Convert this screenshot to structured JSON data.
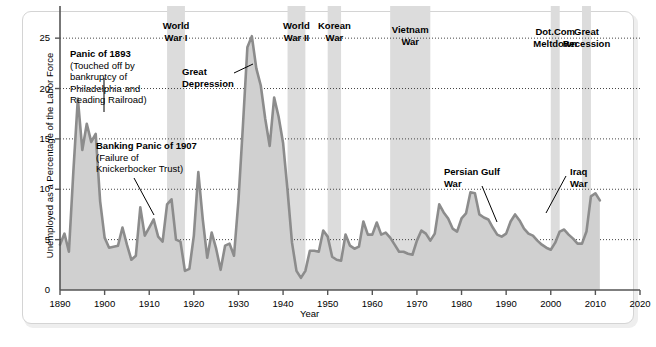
{
  "chart_data": {
    "type": "area",
    "title": "",
    "xlabel": "Year",
    "ylabel": "Unemployed as a Percentage of the Labor Force",
    "xlim": [
      1890,
      2020
    ],
    "ylim": [
      0,
      27
    ],
    "xticks": [
      1890,
      1900,
      1910,
      1920,
      1930,
      1940,
      1950,
      1960,
      1970,
      1980,
      1990,
      2000,
      2010,
      2020
    ],
    "yticks": [
      0,
      5,
      10,
      15,
      20,
      25
    ],
    "grid": "horizontal-dotted",
    "legend": "none",
    "line_color": "#8c8c8c",
    "fill_color": "#d0d0d0",
    "band_color": "#dcdcdc",
    "series": [
      {
        "name": "Unemployment rate",
        "x": [
          1890,
          1891,
          1892,
          1893,
          1894,
          1895,
          1896,
          1897,
          1898,
          1899,
          1900,
          1901,
          1902,
          1903,
          1904,
          1905,
          1906,
          1907,
          1908,
          1909,
          1910,
          1911,
          1912,
          1913,
          1914,
          1915,
          1916,
          1917,
          1918,
          1919,
          1920,
          1921,
          1922,
          1923,
          1924,
          1925,
          1926,
          1927,
          1928,
          1929,
          1930,
          1931,
          1932,
          1933,
          1934,
          1935,
          1936,
          1937,
          1938,
          1939,
          1940,
          1941,
          1942,
          1943,
          1944,
          1945,
          1946,
          1947,
          1948,
          1949,
          1950,
          1951,
          1952,
          1953,
          1954,
          1955,
          1956,
          1957,
          1958,
          1959,
          1960,
          1961,
          1962,
          1963,
          1964,
          1965,
          1966,
          1967,
          1968,
          1969,
          1970,
          1971,
          1972,
          1973,
          1974,
          1975,
          1976,
          1977,
          1978,
          1979,
          1980,
          1981,
          1982,
          1983,
          1984,
          1985,
          1986,
          1987,
          1988,
          1989,
          1990,
          1991,
          1992,
          1993,
          1994,
          1995,
          1996,
          1997,
          1998,
          1999,
          2000,
          2001,
          2002,
          2003,
          2004,
          2005,
          2006,
          2007,
          2008,
          2009,
          2010,
          2011
        ],
        "values": [
          4.5,
          5.6,
          3.8,
          11.8,
          19.0,
          13.9,
          16.5,
          14.7,
          15.5,
          8.8,
          5.2,
          4.2,
          4.3,
          4.4,
          6.2,
          4.5,
          3.0,
          3.4,
          8.2,
          5.4,
          6.2,
          7.0,
          5.3,
          4.8,
          8.5,
          9.0,
          5.0,
          4.8,
          1.9,
          2.1,
          5.4,
          11.7,
          7.0,
          3.2,
          5.7,
          4.1,
          2.0,
          4.4,
          4.6,
          3.4,
          8.9,
          16.3,
          24.1,
          25.2,
          22.0,
          20.3,
          17.0,
          14.3,
          19.1,
          17.2,
          14.6,
          9.9,
          4.7,
          1.9,
          1.2,
          1.9,
          3.9,
          3.9,
          3.8,
          5.9,
          5.3,
          3.3,
          3.0,
          2.9,
          5.5,
          4.4,
          4.1,
          4.3,
          6.8,
          5.5,
          5.5,
          6.7,
          5.5,
          5.7,
          5.2,
          4.5,
          3.8,
          3.8,
          3.6,
          3.5,
          4.9,
          5.9,
          5.6,
          4.9,
          5.6,
          8.5,
          7.7,
          7.1,
          6.1,
          5.8,
          7.1,
          7.6,
          9.7,
          9.6,
          7.5,
          7.2,
          7.0,
          6.2,
          5.5,
          5.3,
          5.6,
          6.8,
          7.5,
          6.9,
          6.1,
          5.6,
          5.4,
          4.9,
          4.5,
          4.2,
          4.0,
          4.7,
          5.8,
          6.0,
          5.5,
          5.1,
          4.6,
          4.6,
          5.8,
          9.3,
          9.6,
          8.9
        ]
      }
    ],
    "bands": [
      {
        "id": "world-war-1",
        "label": "World\nWar I",
        "start": 1914,
        "end": 1918
      },
      {
        "id": "world-war-2",
        "label": "World\nWar II",
        "start": 1941,
        "end": 1945
      },
      {
        "id": "korean-war",
        "label": "Korean\nWar",
        "start": 1950,
        "end": 1953
      },
      {
        "id": "vietnam-war",
        "label": "Vietnam\nWar",
        "start": 1964,
        "end": 1973
      },
      {
        "id": "dotcom",
        "label": "Dot.Com\nMeltdown",
        "start": 2000,
        "end": 2002
      },
      {
        "id": "great-recession",
        "label": "Great\nRecession",
        "start": 2007,
        "end": 2009
      }
    ],
    "annotations": [
      {
        "id": "panic-1893",
        "title": "Panic of 1893",
        "body": "(Touched off by\nbankruptcy of\nPhiladelphia and\nReading Railroad)",
        "target_year": 1894,
        "target_value": 19.0
      },
      {
        "id": "banking-panic-1907",
        "title": "Banking Panic of 1907",
        "body": "(Failure of\nKnickerbocker Trust)",
        "target_year": 1908,
        "target_value": 8.2
      },
      {
        "id": "great-depression",
        "title": "Great\nDepression",
        "body": "",
        "target_year": 1933,
        "target_value": 25.2
      },
      {
        "id": "persian-gulf-war",
        "title": "Persian Gulf\nWar",
        "body": "",
        "target_year": 1991,
        "target_value": 6.8
      },
      {
        "id": "iraq-war",
        "title": "Iraq\nWar",
        "body": "",
        "target_year": 2003,
        "target_value": 6.0
      }
    ]
  }
}
